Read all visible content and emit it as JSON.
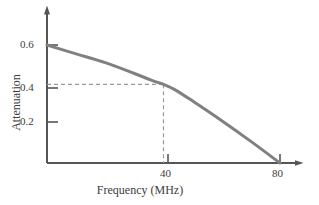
{
  "chart_data": {
    "type": "line",
    "title": "",
    "xlabel": "Frequency (MHz)",
    "ylabel": "Attenuation",
    "xlim": [
      0,
      85
    ],
    "ylim": [
      0,
      0.68
    ],
    "grid": false,
    "legend": "none",
    "x_ticks": [
      {
        "value": 40,
        "label": "40"
      },
      {
        "value": 80,
        "label": "80"
      }
    ],
    "y_ticks": [
      {
        "value": 0.2,
        "label": "0.2"
      },
      {
        "value": 0.4,
        "label": "0.4"
      },
      {
        "value": 0.6,
        "label": "0.6"
      }
    ],
    "series": [
      {
        "name": "Attenuation",
        "color": "#808080",
        "x": [
          0,
          10,
          20,
          30,
          36,
          40,
          44,
          50,
          60,
          70,
          80
        ],
        "values": [
          0.6,
          0.555,
          0.51,
          0.455,
          0.42,
          0.4,
          0.372,
          0.315,
          0.215,
          0.11,
          0.0
        ]
      }
    ],
    "annotations": [
      {
        "name": "guide-line-horizontal",
        "style": "dashed",
        "color": "#9a9a9a",
        "from": {
          "x": 0,
          "y": 0.4
        },
        "to": {
          "x": 40,
          "y": 0.4
        }
      },
      {
        "name": "guide-line-vertical",
        "style": "dashed",
        "color": "#9a9a9a",
        "from": {
          "x": 40,
          "y": 0.4
        },
        "to": {
          "x": 40,
          "y": 0.0
        }
      }
    ],
    "axis_arrows": {
      "x": true,
      "y": true
    },
    "axis_color": "#555555",
    "background": "#ffffff"
  },
  "labels": {
    "y_06": "0.6",
    "y_04": "0.4",
    "y_02": "0.2",
    "x_40": "40",
    "x_80": "80",
    "x_title": "Frequency (MHz)",
    "y_title": "Attenuation"
  }
}
